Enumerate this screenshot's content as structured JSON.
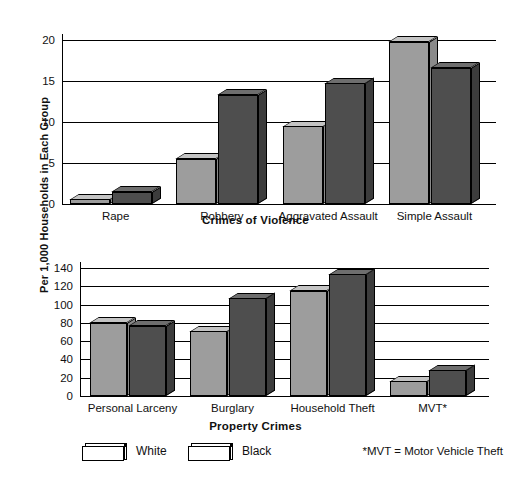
{
  "figure": {
    "shared_ylabel": "Per 1,000 Households in Each Group",
    "legend": [
      {
        "key": "white",
        "label": "White",
        "color": "#9d9d9d"
      },
      {
        "key": "black",
        "label": "Black",
        "color": "#4e4e4e"
      }
    ],
    "footnote": "*MVT = Motor Vehicle Theft"
  },
  "chart_data": [
    {
      "type": "bar",
      "title": "",
      "xlabel": "Crimes of Violence",
      "ylabel": "Per 1,000 Households in Each Group",
      "categories": [
        "Rape",
        "Robbery",
        "Aggravated Assault",
        "Simple Assault"
      ],
      "series": [
        {
          "name": "White",
          "values": [
            0.6,
            5.5,
            9.5,
            19.8
          ]
        },
        {
          "name": "Black",
          "values": [
            1.5,
            13.3,
            14.7,
            16.6
          ]
        }
      ],
      "ylim": [
        0,
        20
      ],
      "yticks": [
        0,
        5,
        10,
        15,
        20
      ],
      "ytick_labels": [
        "0",
        "5",
        "10",
        "15",
        "20"
      ],
      "grid": true,
      "legend_position": "below-figure",
      "style": "3d-bars"
    },
    {
      "type": "bar",
      "title": "",
      "xlabel": "Property Crimes",
      "ylabel": "Per 1,000 Households in Each Group",
      "categories": [
        "Personal Larceny",
        "Burglary",
        "Household Theft",
        "MVT*"
      ],
      "series": [
        {
          "name": "White",
          "values": [
            80,
            71,
            115,
            16
          ]
        },
        {
          "name": "Black",
          "values": [
            77,
            107,
            133,
            28
          ]
        }
      ],
      "ylim": [
        0,
        140
      ],
      "yticks": [
        0,
        20,
        40,
        60,
        80,
        100,
        120,
        140
      ],
      "ytick_labels": [
        "0",
        "20",
        "40",
        "60",
        "80",
        "100",
        "120",
        "140"
      ],
      "grid": true,
      "legend_position": "below-figure",
      "style": "3d-bars",
      "annotations": [
        "*MVT = Motor Vehicle Theft"
      ]
    }
  ]
}
